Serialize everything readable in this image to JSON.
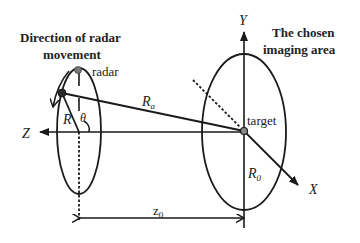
{
  "labels": {
    "direction_title_line1": "Direction of radar",
    "direction_title_line2": "movement",
    "imaging_title_line1": "The chosen",
    "imaging_title_line2": "imaging area",
    "radar": "radar",
    "target": "target",
    "r_a_main": "R",
    "r_a_sub": "a",
    "r": "R",
    "theta": "θ",
    "r0_main": "R",
    "r0_sub": "0",
    "z0_main": "z",
    "z0_sub": "0",
    "axis_x": "X",
    "axis_y": "Y",
    "axis_z": "Z"
  },
  "colors": {
    "stroke": "#1a1a1a",
    "radar_dot": "#777777",
    "target_dot": "#888888"
  }
}
